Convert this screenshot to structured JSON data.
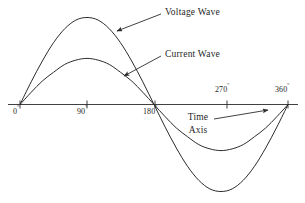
{
  "figure": {
    "ink_color": "#2b2b2b",
    "background_color": "#ffffff"
  },
  "annotations": {
    "voltage_label": "Voltage Wave",
    "current_label": "Current Wave",
    "time_axis_label_line1": "Time",
    "time_axis_label_line2": "Axis"
  },
  "axis": {
    "ticks": [
      {
        "label": "0",
        "degree_symbol": "º",
        "position_deg": 0,
        "label_side": "below"
      },
      {
        "label": "90",
        "degree_symbol": "º",
        "position_deg": 90,
        "label_side": "below"
      },
      {
        "label": "180",
        "degree_symbol": "º",
        "position_deg": 180,
        "label_side": "below"
      },
      {
        "label": "270",
        "degree_symbol": "º",
        "position_deg": 270,
        "label_side": "above"
      },
      {
        "label": "360",
        "degree_symbol": "º",
        "position_deg": 360,
        "label_side": "above"
      }
    ]
  },
  "chart_data": {
    "type": "line",
    "title": "",
    "xlabel": "Time Axis",
    "ylabel": "",
    "xlim": [
      0,
      360
    ],
    "ylim": [
      -1.05,
      1.05
    ],
    "grid": false,
    "legend": "inline-callout-arrows",
    "x_tick_labels": [
      "0º",
      "90º",
      "180º",
      "270º",
      "360º"
    ],
    "x_ticks": [
      0,
      90,
      180,
      270,
      360
    ],
    "series": [
      {
        "name": "Voltage Wave",
        "amplitude": 1.0,
        "phase_deg": 0,
        "x": [
          0,
          15,
          30,
          45,
          60,
          75,
          90,
          105,
          120,
          135,
          150,
          165,
          180,
          195,
          210,
          225,
          240,
          255,
          270,
          285,
          300,
          315,
          330,
          345,
          360
        ],
        "values": [
          0,
          0.26,
          0.5,
          0.71,
          0.87,
          0.97,
          1.0,
          0.97,
          0.87,
          0.71,
          0.5,
          0.26,
          0,
          -0.26,
          -0.5,
          -0.71,
          -0.87,
          -0.97,
          -1.0,
          -0.97,
          -0.87,
          -0.71,
          -0.5,
          -0.26,
          0
        ]
      },
      {
        "name": "Current Wave",
        "amplitude": 0.53,
        "phase_deg": 0,
        "x": [
          0,
          15,
          30,
          45,
          60,
          75,
          90,
          105,
          120,
          135,
          150,
          165,
          180,
          195,
          210,
          225,
          240,
          255,
          270,
          285,
          300,
          315,
          330,
          345,
          360
        ],
        "values": [
          0,
          0.14,
          0.27,
          0.37,
          0.46,
          0.51,
          0.53,
          0.51,
          0.46,
          0.37,
          0.27,
          0.14,
          0,
          -0.14,
          -0.27,
          -0.37,
          -0.46,
          -0.51,
          -0.53,
          -0.51,
          -0.46,
          -0.37,
          -0.27,
          -0.14,
          0
        ]
      }
    ]
  }
}
